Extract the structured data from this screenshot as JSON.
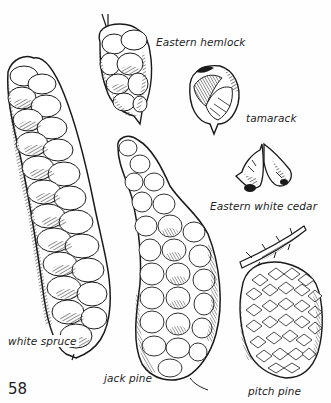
{
  "page": {
    "number": "58",
    "ink_color": "#1a1a1a",
    "background": "#ffffff"
  },
  "illustrations": [
    {
      "id": "eastern-hemlock",
      "label": "Eastern hemlock"
    },
    {
      "id": "tamarack",
      "label": "tamarack"
    },
    {
      "id": "eastern-white-cedar",
      "label": "Eastern white cedar"
    },
    {
      "id": "white-spruce",
      "label": "white spruce"
    },
    {
      "id": "jack-pine",
      "label": "jack pine"
    },
    {
      "id": "pitch-pine",
      "label": "pitch pine"
    }
  ]
}
